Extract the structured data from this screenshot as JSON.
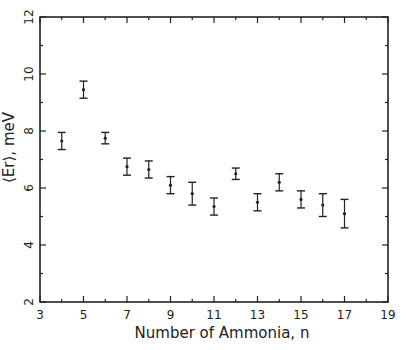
{
  "chart_data": {
    "type": "scatter",
    "title": "",
    "xlabel": "Number of Ammonia, n",
    "ylabel": "⟨Er⟩, meV",
    "xlim": [
      3,
      19
    ],
    "ylim": [
      2,
      12
    ],
    "xticks_major": [
      3,
      5,
      7,
      9,
      11,
      13,
      15,
      17,
      19
    ],
    "xticks_minor": [
      4,
      6,
      8,
      10,
      12,
      14,
      16,
      18
    ],
    "yticks_major": [
      2,
      4,
      6,
      8,
      10,
      12
    ],
    "yticks_minor": [
      3,
      5,
      7,
      9,
      11
    ],
    "grid": false,
    "series": [
      {
        "name": "Er",
        "points": [
          {
            "x": 4,
            "y": 7.65,
            "err": 0.3
          },
          {
            "x": 5,
            "y": 9.45,
            "err": 0.3
          },
          {
            "x": 6,
            "y": 7.75,
            "err": 0.2
          },
          {
            "x": 7,
            "y": 6.75,
            "err": 0.3
          },
          {
            "x": 8,
            "y": 6.65,
            "err": 0.3
          },
          {
            "x": 9,
            "y": 6.1,
            "err": 0.3
          },
          {
            "x": 10,
            "y": 5.8,
            "err": 0.4
          },
          {
            "x": 11,
            "y": 5.35,
            "err": 0.3
          },
          {
            "x": 12,
            "y": 6.5,
            "err": 0.2
          },
          {
            "x": 13,
            "y": 5.5,
            "err": 0.3
          },
          {
            "x": 14,
            "y": 6.2,
            "err": 0.3
          },
          {
            "x": 15,
            "y": 5.6,
            "err": 0.3
          },
          {
            "x": 16,
            "y": 5.4,
            "err": 0.4
          },
          {
            "x": 17,
            "y": 5.1,
            "err": 0.5
          }
        ]
      }
    ]
  },
  "colors": {
    "ink": "#222222",
    "background": "#ffffff"
  }
}
